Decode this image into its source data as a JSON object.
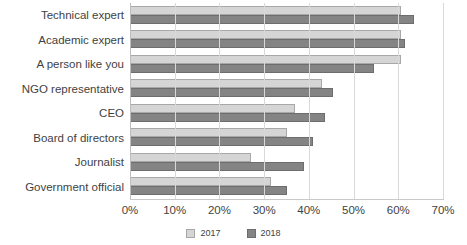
{
  "chart_data": {
    "type": "bar",
    "orientation": "horizontal",
    "title": "",
    "subtitle": "",
    "xlabel": "",
    "ylabel": "",
    "xlim": [
      0,
      70
    ],
    "grid": true,
    "legend_position": "bottom",
    "xticks": [
      "0%",
      "10%",
      "20%",
      "30%",
      "40%",
      "50%",
      "60%",
      "70%"
    ],
    "xtick_values": [
      0,
      10,
      20,
      30,
      40,
      50,
      60,
      70
    ],
    "categories": [
      "Technical expert",
      "Academic expert",
      "A person like you",
      "NGO representative",
      "CEO",
      "Board of directors",
      "Journalist",
      "Government official"
    ],
    "series": [
      {
        "name": "2017",
        "color": "#d5d5d5",
        "values": [
          60.5,
          60.5,
          60.5,
          43.0,
          37.0,
          35.0,
          27.0,
          31.5
        ]
      },
      {
        "name": "2018",
        "color": "#848484",
        "values": [
          63.5,
          61.5,
          54.5,
          45.5,
          43.5,
          41.0,
          39.0,
          35.0
        ]
      }
    ]
  },
  "legend": {
    "items": [
      {
        "label": "2017",
        "color": "#d5d5d5"
      },
      {
        "label": "2018",
        "color": "#848484"
      }
    ]
  },
  "colors": {
    "series_2017": "#d5d5d5",
    "series_2018": "#848484",
    "gridline": "#d9d9d9",
    "text": "#3f3f3f",
    "background": "#ffffff"
  }
}
